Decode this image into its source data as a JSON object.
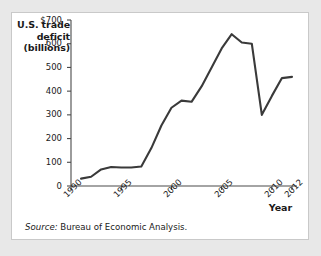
{
  "figure": {
    "source_label": "Source:",
    "source_text": "Bureau of Economic Analysis.",
    "panel_background": "#ffffff",
    "page_background": "#e8e8e8"
  },
  "chart_data": {
    "type": "line",
    "title": "",
    "ylabel": "U.S. trade deficit (billions)",
    "ylabel_lines": [
      "U.S. trade",
      "deficit",
      "(billions)"
    ],
    "xlabel": "Year",
    "xlim": [
      1990,
      2012.5
    ],
    "ylim": [
      0,
      700
    ],
    "grid": false,
    "legend": "none",
    "line_color": "#3a3a3a",
    "line_width": 2.1,
    "y_ticks": [
      0,
      100,
      200,
      300,
      400,
      500,
      600,
      700
    ],
    "y_tick_labels": [
      "0",
      "100",
      "200",
      "300",
      "400",
      "500",
      "600",
      "$700"
    ],
    "x_ticks": [
      1990,
      1995,
      2000,
      2005,
      2010,
      2012
    ],
    "x_tick_labels": [
      "1990",
      "1995",
      "2000",
      "2005",
      "2010",
      "2012"
    ],
    "x": [
      1991,
      1992,
      1993,
      1994,
      1995,
      1996,
      1997,
      1998,
      1999,
      2000,
      2001,
      2002,
      2003,
      2004,
      2005,
      2006,
      2007,
      2008,
      2009,
      2010,
      2011,
      2012
    ],
    "values": [
      31,
      39,
      70,
      80,
      78,
      78,
      82,
      160,
      255,
      330,
      360,
      355,
      420,
      500,
      580,
      640,
      605,
      600,
      300,
      380,
      455,
      460
    ]
  }
}
